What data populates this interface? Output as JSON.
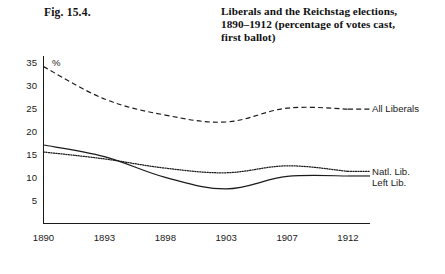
{
  "figure": {
    "caption": "Fig. 15.4.",
    "title_lines": [
      "Liberals and the Reichstag elections,",
      "1890–1912 (percentage of votes cast,",
      "first ballot)"
    ]
  },
  "chart_data": {
    "type": "line",
    "xlabel": "",
    "ylabel": "%",
    "unit_label": "%",
    "categories": [
      "1890",
      "1893",
      "1898",
      "1903",
      "1907",
      "1912"
    ],
    "x": [
      1890,
      1893,
      1898,
      1903,
      1907,
      1912
    ],
    "xticklabels": [
      "1890",
      "1893",
      "1898",
      "1903",
      "1907",
      "1912"
    ],
    "yticks": [
      5,
      10,
      15,
      20,
      25,
      30,
      35
    ],
    "yticklabels": [
      "5",
      "10",
      "15",
      "20",
      "25",
      "30",
      "35"
    ],
    "ylim": [
      0,
      36.5
    ],
    "grid": false,
    "legend_position": "right-inline",
    "series": [
      {
        "name": "All Liberals",
        "style": "dashed",
        "label": "All Liberals",
        "values": [
          34.0,
          27.0,
          23.5,
          22.0,
          25.0,
          24.8
        ]
      },
      {
        "name": "Natl. Lib.",
        "style": "dotted",
        "label": "Natl. Lib.",
        "values": [
          15.5,
          14.0,
          12.0,
          11.0,
          12.5,
          11.3
        ]
      },
      {
        "name": "Left Lib.",
        "style": "solid",
        "label": "Left Lib.",
        "values": [
          17.0,
          14.5,
          10.0,
          7.5,
          10.2,
          10.3
        ]
      }
    ]
  },
  "colors": {
    "ink": "#1a1a1a",
    "background": "#ffffff"
  }
}
